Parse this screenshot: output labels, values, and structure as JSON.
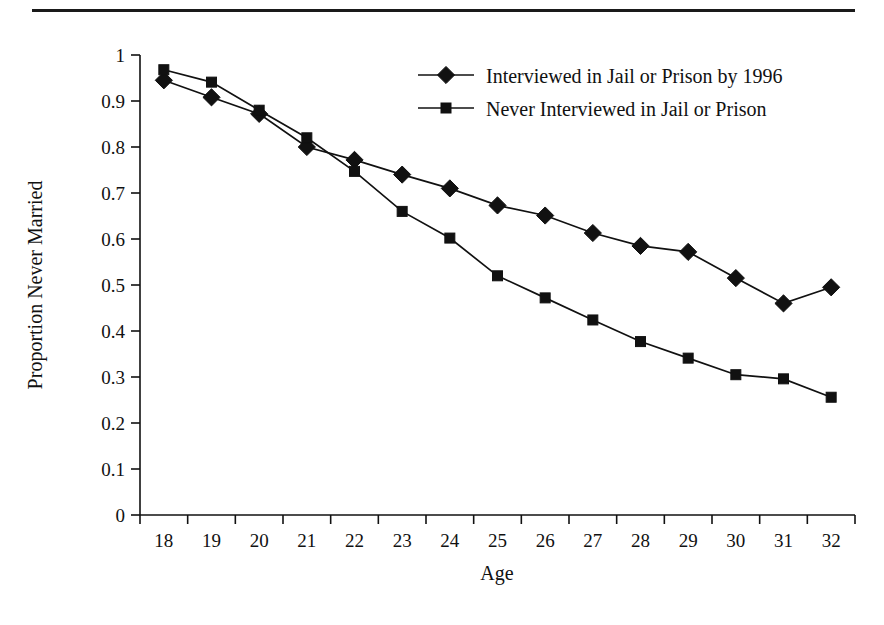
{
  "chart_data": {
    "type": "line",
    "title": "",
    "xlabel": "Age",
    "ylabel": "Proportion Never Married",
    "x": [
      18,
      19,
      20,
      21,
      22,
      23,
      24,
      25,
      26,
      27,
      28,
      29,
      30,
      31,
      32
    ],
    "xtick_labels": [
      "18",
      "19",
      "20",
      "21",
      "22",
      "23",
      "24",
      "25",
      "26",
      "27",
      "28",
      "29",
      "30",
      "31",
      "32"
    ],
    "ytick_labels": [
      "0",
      "0.1",
      "0.2",
      "0.3",
      "0.4",
      "0.5",
      "0.6",
      "0.7",
      "0.8",
      "0.9",
      "1"
    ],
    "ytick_values": [
      0,
      0.1,
      0.2,
      0.3,
      0.4,
      0.5,
      0.6,
      0.7,
      0.8,
      0.9,
      1
    ],
    "ylim": [
      0,
      1
    ],
    "xlim": [
      18,
      32
    ],
    "grid": false,
    "legend_position": "top-right",
    "series": [
      {
        "name": "Interviewed in Jail or Prison by 1996",
        "marker": "diamond",
        "color": "#111111",
        "values": [
          0.945,
          0.908,
          0.872,
          0.8,
          0.772,
          0.74,
          0.71,
          0.673,
          0.651,
          0.613,
          0.585,
          0.572,
          0.515,
          0.46,
          0.495
        ]
      },
      {
        "name": "Never Interviewed in Jail or Prison",
        "marker": "square",
        "color": "#111111",
        "values": [
          0.968,
          0.941,
          0.88,
          0.82,
          0.747,
          0.66,
          0.602,
          0.52,
          0.472,
          0.424,
          0.377,
          0.341,
          0.305,
          0.296,
          0.256
        ]
      }
    ]
  },
  "legend": {
    "items": [
      {
        "label": "Interviewed in Jail or Prison by 1996",
        "marker": "diamond"
      },
      {
        "label": "Never Interviewed in Jail or Prison",
        "marker": "square"
      }
    ]
  },
  "axes": {
    "x_title": "Age",
    "y_title": "Proportion Never Married"
  }
}
